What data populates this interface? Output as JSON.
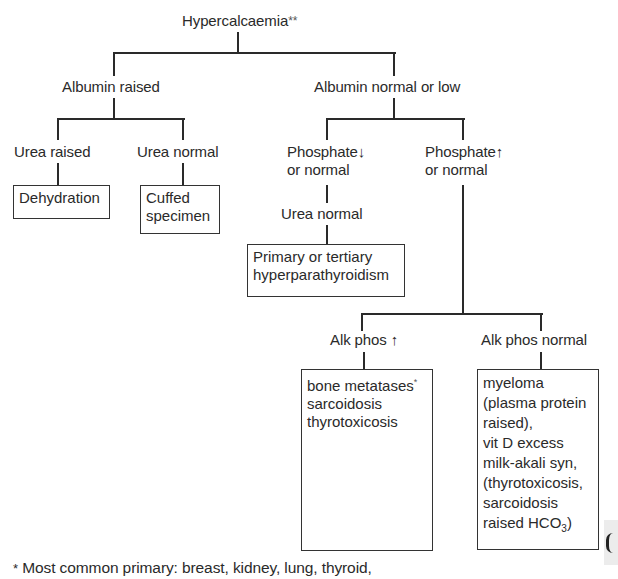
{
  "root": {
    "label": "Hypercalcaemia",
    "marker": "**"
  },
  "level1": {
    "left": "Albumin raised",
    "right": "Albumin normal or low"
  },
  "left_branch": {
    "urea_raised": "Urea raised",
    "urea_normal": "Urea normal",
    "dehydration_box": "Dehydration",
    "cuffed_box": [
      "Cuffed",
      "specimen"
    ]
  },
  "right_branch": {
    "phosphate_low": {
      "line1": "Phosphate",
      "arrow": "↓",
      "line2": "or normal"
    },
    "phosphate_high": {
      "line1": "Phosphate",
      "arrow": "↑",
      "line2": "or normal"
    },
    "urea_normal": "Urea normal",
    "primary_box": [
      "Primary or tertiary",
      "hyperparathyroidism"
    ],
    "alk_phos_high": {
      "label": "Alk phos",
      "arrow": "↑"
    },
    "alk_phos_normal": "Alk phos normal",
    "bone_box": {
      "line1": "bone metatases",
      "line1_marker": "*",
      "line2": "sarcoidosis",
      "line3": "thyrotoxicosis"
    },
    "myeloma_box": {
      "lines": [
        "myeloma",
        "(plasma protein",
        "raised),",
        "vit D excess",
        "milk-akali syn,",
        "(thyrotoxicosis,",
        "sarcoidosis"
      ],
      "last_prefix": "raised HCO",
      "last_sub": "3",
      "last_suffix": ")"
    }
  },
  "footnote": {
    "marker": "*",
    "text": "Most common primary: breast, kidney, lung, thyroid,"
  },
  "colors": {
    "line": "#2a2a2a",
    "text": "#2a2a2a",
    "background": "#ffffff"
  }
}
